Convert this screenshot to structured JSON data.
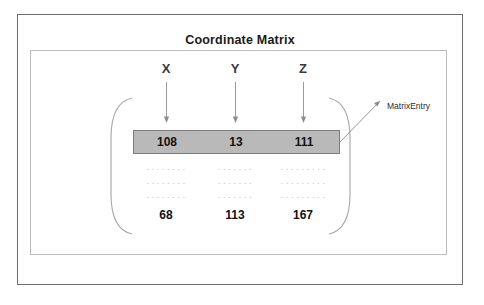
{
  "diagram": {
    "title": "Coordinate Matrix",
    "columns": [
      {
        "label": "X",
        "x": 166
      },
      {
        "label": "Y",
        "x": 235
      },
      {
        "label": "Z",
        "x": 303
      }
    ],
    "highlighted_row": {
      "name": "MatrixEntry",
      "values": [
        "108",
        "13",
        "111"
      ]
    },
    "ellipsis_rows": [
      [
        "........",
        ".......",
        "........."
      ],
      [
        "........",
        ".......",
        "........."
      ],
      [
        "........",
        ".......",
        "........."
      ]
    ],
    "last_row": {
      "values": [
        "68",
        "113",
        "167"
      ]
    },
    "callout": {
      "label": "MatrixEntry"
    },
    "colors": {
      "highlight_fill": "#b9b9b9",
      "highlight_stroke": "#7d7d7d",
      "outer_border": "#6f6f6f",
      "inner_border": "#bdbdbd",
      "bracket": "#9a9a9a",
      "arrow": "#8d8d8d",
      "background": "#ffffff"
    }
  }
}
